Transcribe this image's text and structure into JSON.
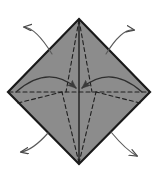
{
  "figure": {
    "type": "origami-fold-diagram",
    "title": "",
    "background_color": "#ffffff",
    "canvas": {
      "width": 157,
      "height": 174
    }
  },
  "shape": {
    "name": "diamond",
    "description": "square rotated 45 degrees (kite base outline)",
    "fill_color": "#8a8a8a",
    "stroke_color": "#1a1a1a",
    "stroke_width": 2.2,
    "vertices": {
      "top": {
        "x": 79,
        "y": 19
      },
      "right": {
        "x": 150,
        "y": 92
      },
      "bottom": {
        "x": 79,
        "y": 164
      },
      "left": {
        "x": 8,
        "y": 92
      }
    },
    "center": {
      "x": 79,
      "y": 92
    }
  },
  "creases": {
    "stroke_color": "#1f1f1f",
    "dash_pattern": "4 3",
    "dash_width": 1.1,
    "solid_width": 1.4,
    "solid_lines": [
      {
        "name": "vertical-center-crease",
        "x1": 79,
        "y1": 19,
        "x2": 79,
        "y2": 164
      }
    ],
    "dashed_lines": [
      {
        "name": "horizontal-center-crease",
        "x1": 9,
        "y1": 92,
        "x2": 149,
        "y2": 92
      },
      {
        "name": "top-left-fan-crease",
        "x1": 79,
        "y1": 20,
        "x2": 66,
        "y2": 92
      },
      {
        "name": "top-right-fan-crease",
        "x1": 79,
        "y1": 20,
        "x2": 92,
        "y2": 92
      },
      {
        "name": "bottom-left-fan-crease",
        "x1": 79,
        "y1": 163,
        "x2": 62,
        "y2": 92
      },
      {
        "name": "bottom-right-fan-crease",
        "x1": 79,
        "y1": 163,
        "x2": 96,
        "y2": 92
      },
      {
        "name": "left-lower-diagonal-crease",
        "x1": 18,
        "y1": 103,
        "x2": 62,
        "y2": 92
      },
      {
        "name": "right-lower-diagonal-crease",
        "x1": 140,
        "y1": 103,
        "x2": 96,
        "y2": 92
      }
    ]
  },
  "arrows": {
    "stroke_color": "#4a4a4a",
    "stroke_width": 1.2,
    "head_color": "#4a4a4a",
    "inward": [
      {
        "name": "left-inward-fold-arrow",
        "label": "fold left point to center",
        "path": "M 16,92 Q 48,64 76,88",
        "tip": {
          "x": 78,
          "y": 90
        },
        "direction": "right"
      },
      {
        "name": "right-inward-fold-arrow",
        "label": "fold right point to center",
        "path": "M 142,92 Q 110,64 82,88",
        "tip": {
          "x": 80,
          "y": 90
        },
        "direction": "left"
      }
    ],
    "outward": [
      {
        "name": "top-left-unfold-arrow",
        "label": "pull upper-left flap out",
        "path": "M 52,54 Q 36,28 24,27",
        "tip": {
          "x": 21,
          "y": 27
        },
        "direction": "up-left"
      },
      {
        "name": "top-right-unfold-arrow",
        "label": "pull upper-right flap out",
        "path": "M 106,54 Q 122,28 134,30",
        "tip": {
          "x": 137,
          "y": 31
        },
        "direction": "up-right"
      },
      {
        "name": "bottom-left-unfold-arrow",
        "label": "pull lower-left flap out",
        "path": "M 48,133 Q 33,150 21,152",
        "tip": {
          "x": 18,
          "y": 152
        },
        "direction": "down-left"
      },
      {
        "name": "bottom-right-unfold-arrow",
        "label": "pull lower-right flap out",
        "path": "M 111,132 Q 126,150 137,156",
        "tip": {
          "x": 140,
          "y": 158
        },
        "direction": "down-right"
      }
    ]
  },
  "legend": {
    "dashed_means": "valley/mountain crease line",
    "solid_means": "existing edge or fold",
    "arrow_means": "fold direction"
  }
}
